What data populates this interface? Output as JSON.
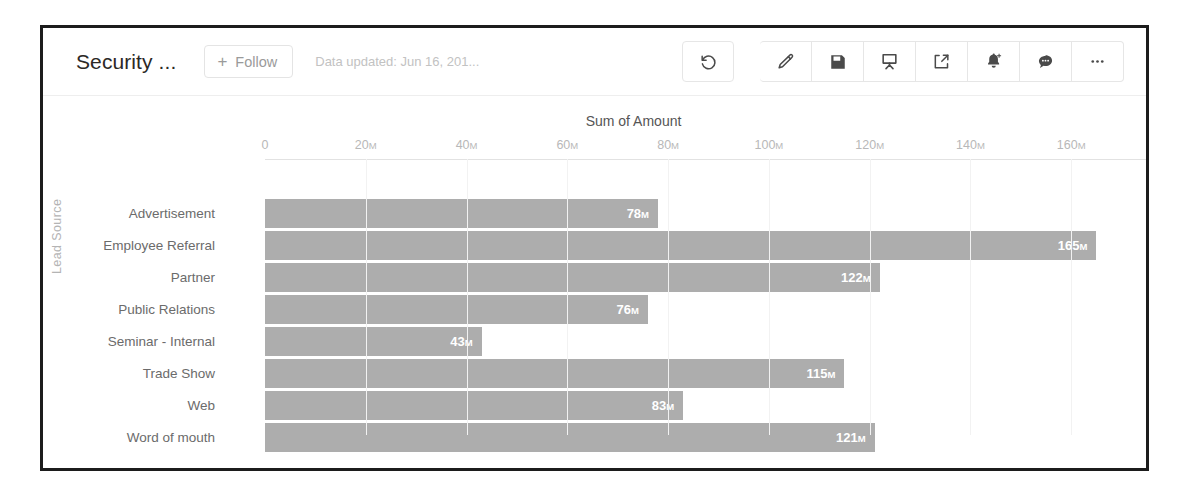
{
  "header": {
    "title": "Security ...",
    "follow_label": "Follow",
    "follow_plus": "+",
    "data_updated": "Data updated: Jun 16, 201...",
    "toolbar": [
      {
        "name": "refresh-icon",
        "label": "Refresh"
      },
      {
        "name": "edit-pencil-icon",
        "label": "Edit"
      },
      {
        "name": "save-floppy-icon",
        "label": "Save"
      },
      {
        "name": "presentation-icon",
        "label": "Present"
      },
      {
        "name": "share-icon",
        "label": "Share"
      },
      {
        "name": "bell-plus-icon",
        "label": "Subscribe"
      },
      {
        "name": "chat-bubble-icon",
        "label": "Comments"
      },
      {
        "name": "more-ellipsis-icon",
        "label": "More"
      }
    ]
  },
  "colors": {
    "bar_fill": "#adadad",
    "bar_label": "#ffffff",
    "tick_label": "#b8b8b8",
    "category_label": "#6b6b6b",
    "frame": "#1c1c1c"
  },
  "chart_data": {
    "type": "bar",
    "orientation": "horizontal",
    "title": "Sum of Amount",
    "xlabel": "Sum of Amount",
    "ylabel": "Lead Source",
    "categories": [
      "Advertisement",
      "Employee Referral",
      "Partner",
      "Public Relations",
      "Seminar - Internal",
      "Trade Show",
      "Web",
      "Word of mouth"
    ],
    "values": [
      78,
      165,
      122,
      76,
      43,
      115,
      83,
      121
    ],
    "value_labels": [
      "78M",
      "165M",
      "122M",
      "76M",
      "43M",
      "115M",
      "83M",
      "121M"
    ],
    "unit_suffix": "M",
    "xlim": [
      0,
      180
    ],
    "xticks": [
      0,
      20,
      40,
      60,
      80,
      100,
      120,
      140,
      160,
      180
    ],
    "xtick_labels": [
      "0",
      "20M",
      "40M",
      "60M",
      "80M",
      "100M",
      "120M",
      "140M",
      "160M",
      "180M"
    ],
    "grid": true,
    "legend": false
  }
}
